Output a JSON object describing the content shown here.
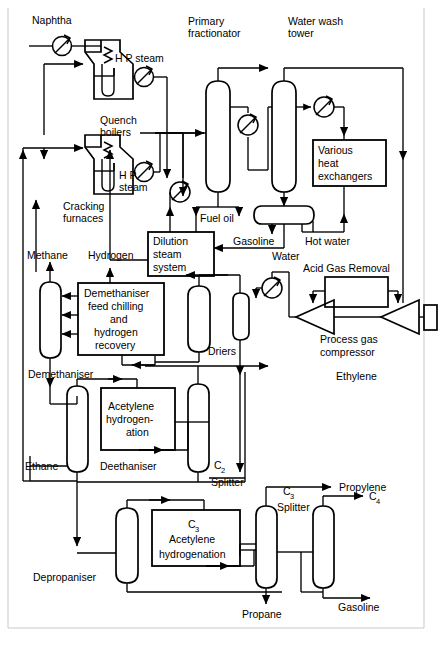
{
  "diagram": {
    "type": "process-flow-diagram",
    "stroke_color": "#000000",
    "background_color": "#ffffff",
    "border_color": "#bdbdbd"
  },
  "labels": {
    "naphtha": "Naphtha",
    "hp_steam_1": "H P steam",
    "hp_steam_2a": "H P",
    "hp_steam_2b": "steam",
    "quench_boilers_a": "Quench",
    "quench_boilers_b": "boilers",
    "cracking_furnaces_a": "Cracking",
    "cracking_furnaces_b": "furnaces",
    "primary_fractionator_a": "Primary",
    "primary_fractionator_b": "fractionator",
    "water_wash_tower_a": "Water wash",
    "water_wash_tower_b": "tower",
    "various_heat_exchangers_a": "Various",
    "various_heat_exchangers_b": "heat",
    "various_heat_exchangers_c": "exchangers",
    "fuel_oil": "Fuel oil",
    "dilution_steam_system_a": "Dilution",
    "dilution_steam_system_b": "steam",
    "dilution_steam_system_c": "system",
    "gasoline_top": "Gasoline",
    "water_mid": "Water",
    "hot_water": "Hot water",
    "acid_gas_removal": "Acid Gas Removal",
    "process_gas_compressor_a": "Process gas",
    "process_gas_compressor_b": "compressor",
    "methane": "Methane",
    "hydrogen": "Hydrogen",
    "demeth_feed_chill_a": "Demethaniser",
    "demeth_feed_chill_b": "feed chilling",
    "demeth_feed_chill_c": "and",
    "demeth_feed_chill_d": "hydrogen",
    "demeth_feed_chill_e": "recovery",
    "driers": "Driers",
    "demethaniser": "Demethaniser",
    "ethylene": "Ethylene",
    "acetylene_hydro_a": "Acetylene",
    "acetylene_hydro_b": "hydrogen-",
    "acetylene_hydro_c": "ation",
    "ethane": "Ethane",
    "deethaniser": "Deethaniser",
    "c2_main": "C",
    "c2_sub": "2",
    "c2_splitter": "Splitter",
    "c3_main": "C",
    "c3_sub": "3",
    "c3_splitter": "Splitter",
    "propylene": "Propylene",
    "c4_main": "C",
    "c4_sub": "4",
    "c3_acetylene_main": "C",
    "c3_acetylene_sub": "3",
    "c3_acetylene_b": "Acetylene",
    "c3_acetylene_c": "hydrogenation",
    "depropaniser": "Depropaniser",
    "propane": "Propane",
    "gasoline_bottom": "Gasoline"
  },
  "equipment": [
    {
      "name": "cracking-furnace-1",
      "kind": "fired-furnace"
    },
    {
      "name": "cracking-furnace-2",
      "kind": "fired-furnace"
    },
    {
      "name": "quench-boiler-1",
      "kind": "heat-exchanger"
    },
    {
      "name": "quench-boiler-2",
      "kind": "heat-exchanger"
    },
    {
      "name": "naphtha-preheater",
      "kind": "heat-exchanger"
    },
    {
      "name": "primary-fractionator",
      "kind": "column"
    },
    {
      "name": "primary-fractionator-cooler",
      "kind": "heat-exchanger"
    },
    {
      "name": "fuel-oil-cooler",
      "kind": "heat-exchanger"
    },
    {
      "name": "water-wash-tower",
      "kind": "column"
    },
    {
      "name": "water-wash-cooler",
      "kind": "heat-exchanger"
    },
    {
      "name": "quench-water-drum",
      "kind": "horizontal-drum"
    },
    {
      "name": "various-heat-exchangers",
      "kind": "box"
    },
    {
      "name": "dilution-steam-system",
      "kind": "box"
    },
    {
      "name": "acid-gas-removal",
      "kind": "box"
    },
    {
      "name": "process-gas-compressor-stage-1",
      "kind": "compressor"
    },
    {
      "name": "process-gas-compressor-stage-2",
      "kind": "compressor"
    },
    {
      "name": "compressor-driver",
      "kind": "driver"
    },
    {
      "name": "driers-vessel",
      "kind": "vessel"
    },
    {
      "name": "driers-small-vessel",
      "kind": "vessel"
    },
    {
      "name": "driers-cooler",
      "kind": "heat-exchanger"
    },
    {
      "name": "demethaniser-feed-chilling",
      "kind": "box"
    },
    {
      "name": "demethaniser-column",
      "kind": "column"
    },
    {
      "name": "deethaniser-column",
      "kind": "column"
    },
    {
      "name": "acetylene-hydrogenation",
      "kind": "box"
    },
    {
      "name": "c2-splitter-column",
      "kind": "column"
    },
    {
      "name": "depropaniser-column",
      "kind": "column"
    },
    {
      "name": "c3-acetylene-hydrogenation",
      "kind": "box"
    },
    {
      "name": "c3-splitter-column",
      "kind": "column"
    },
    {
      "name": "debutaniser-column",
      "kind": "column"
    }
  ],
  "streams": [
    "Naphtha",
    "H P steam",
    "Fuel oil",
    "Gasoline",
    "Water",
    "Hot water",
    "Methane",
    "Hydrogen",
    "Ethylene",
    "Ethane",
    "Propylene",
    "Propane",
    "C4",
    "Gasoline"
  ]
}
